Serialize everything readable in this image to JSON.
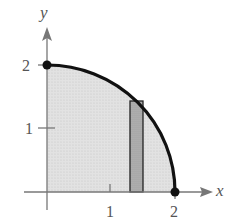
{
  "figure": {
    "axes": {
      "x_label": "x",
      "y_label": "y",
      "x_ticks": [
        {
          "value": 1,
          "label": "1"
        },
        {
          "value": 2,
          "label": "2"
        }
      ],
      "y_ticks": [
        {
          "value": 1,
          "label": "1"
        },
        {
          "value": 2,
          "label": "2"
        }
      ]
    },
    "curve": {
      "description": "quarter circle arc of radius 2 from (0,2) to (2,0)",
      "endpoints": [
        {
          "x": 0,
          "y": 2
        },
        {
          "x": 2,
          "y": 0
        }
      ]
    },
    "region": {
      "description": "shaded region under the arc in first quadrant"
    },
    "rectangle": {
      "x_left": 1.3,
      "x_right": 1.5,
      "height": 1.43,
      "description": "representative vertical rectangle"
    },
    "colors": {
      "region_fill": "#dcdcdc",
      "rectangle_fill": "#a8a8a8",
      "curve": "#111111",
      "axis": "#777777"
    }
  }
}
